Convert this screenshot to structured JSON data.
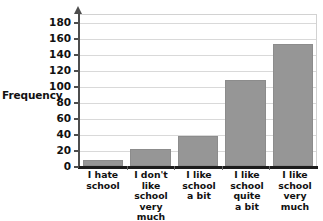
{
  "chart_data": {
    "type": "bar",
    "title": "",
    "xlabel": "",
    "ylabel": "Frequency",
    "categories": [
      "I hate school",
      "I don't like school very much",
      "I like school a bit",
      "I like school quite a bit",
      "I like school very much"
    ],
    "category_lines": [
      [
        "I hate",
        "school"
      ],
      [
        "I don't",
        "like",
        "school",
        "very much"
      ],
      [
        "I like",
        "school",
        "a bit"
      ],
      [
        "I like",
        "school",
        "quite",
        "a bit"
      ],
      [
        "I like",
        "school",
        "very",
        "much"
      ]
    ],
    "values": [
      8,
      21,
      38,
      107,
      152
    ],
    "ylim": [
      0,
      190
    ],
    "ytick_step": 20,
    "yticks": [
      0,
      20,
      40,
      60,
      80,
      100,
      120,
      140,
      160,
      180
    ],
    "ytick_labels": [
      "0",
      "20",
      "40",
      "60",
      "80",
      "100",
      "120",
      "140",
      "160",
      "180"
    ],
    "grid": true,
    "legend": null,
    "bar_color": "#969696",
    "gridline_color": "#d9d9d9",
    "axis_color": "#4d4d4d",
    "baseline_color": "#1c1c1c"
  },
  "axis": {
    "y_title": "Frequency"
  },
  "title": {
    "text": ""
  }
}
